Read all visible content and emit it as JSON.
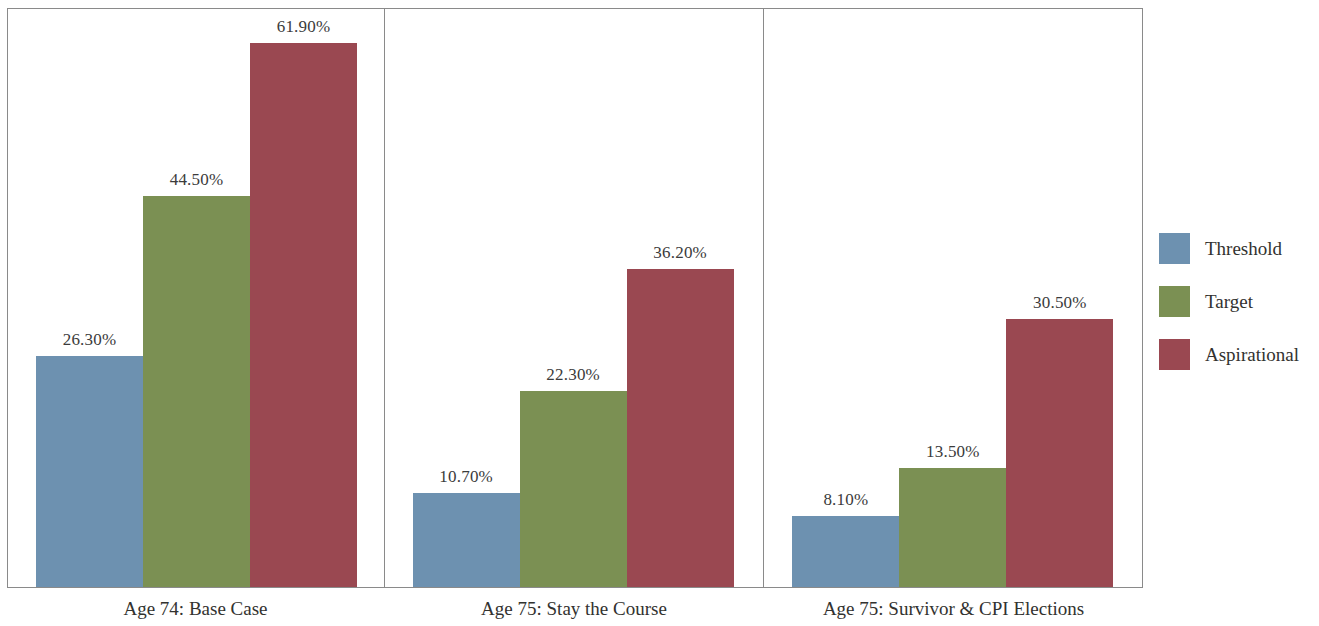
{
  "chart_data": {
    "type": "bar",
    "title": "",
    "subtitle": "",
    "xlabel": "",
    "ylabel": "",
    "grid": false,
    "legend_position": "right",
    "axis_max_percent": 66,
    "categories": [
      "Threshold",
      "Target",
      "Aspirational"
    ],
    "facets": [
      {
        "label": "Age 74: Base Case",
        "values": [
          26.3,
          44.5,
          61.9
        ],
        "value_labels": [
          "26.30%",
          "44.50%",
          "61.90%"
        ]
      },
      {
        "label": "Age 75: Stay the Course",
        "values": [
          10.7,
          22.3,
          36.2
        ],
        "value_labels": [
          "10.70%",
          "22.30%",
          "36.20%"
        ]
      },
      {
        "label": "Age 75: Survivor & CPI Elections",
        "values": [
          8.1,
          13.5,
          30.5
        ],
        "value_labels": [
          "8.10%",
          "13.50%",
          "30.50%"
        ]
      }
    ],
    "series": [
      {
        "name": "Threshold",
        "values": [
          26.3,
          10.7,
          8.1
        ],
        "color": "#6d91b0"
      },
      {
        "name": "Target",
        "values": [
          44.5,
          22.3,
          13.5
        ],
        "color": "#7b9053"
      },
      {
        "name": "Aspirational",
        "values": [
          61.9,
          36.2,
          30.5
        ],
        "color": "#9a4851"
      }
    ]
  },
  "legend": {
    "items": [
      {
        "label": "Threshold",
        "color": "#6d91b0"
      },
      {
        "label": "Target",
        "color": "#7b9053"
      },
      {
        "label": "Aspirational",
        "color": "#9a4851"
      }
    ]
  },
  "colors": {
    "threshold": "#6d91b0",
    "target": "#7b9053",
    "aspirational": "#9a4851",
    "frame": "#8a8a8a",
    "text": "#32322f",
    "label_text": "#3b3b3b",
    "background": "#ffffff"
  }
}
